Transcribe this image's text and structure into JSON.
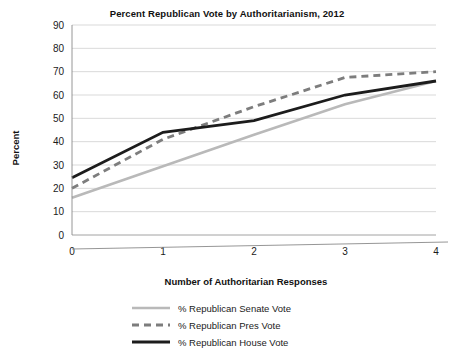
{
  "chart_data": {
    "type": "line",
    "title": "Percent Republican Vote by Authoritarianism, 2012",
    "xlabel": "Number of Authoritarian Responses",
    "ylabel": "Percent",
    "x": [
      0,
      1,
      2,
      3,
      4
    ],
    "xticklabels": [
      "0",
      "1",
      "2",
      "3",
      "4"
    ],
    "yticklabels": [
      "0",
      "10",
      "20",
      "30",
      "40",
      "50",
      "60",
      "70",
      "80",
      "90"
    ],
    "xlim": [
      0,
      4
    ],
    "ylim": [
      0,
      90
    ],
    "ytick_step": 10,
    "grid": "horizontal",
    "legend_position": "below",
    "series": [
      {
        "name": "% Republican Senate Vote",
        "values": [
          16,
          29.5,
          43,
          56,
          66
        ],
        "color": "#b9b9b9",
        "style": "solid",
        "width": 2.6
      },
      {
        "name": "% Republican Pres Vote",
        "values": [
          20,
          41,
          55,
          67.5,
          70
        ],
        "color": "#7d7d7d",
        "style": "dashed",
        "width": 2.8
      },
      {
        "name": "% Republican House Vote",
        "values": [
          24.5,
          44,
          49,
          60,
          66
        ],
        "color": "#1c1c1c",
        "style": "solid",
        "width": 2.8
      }
    ]
  },
  "legend": {
    "items": [
      {
        "label": "% Republican Senate Vote"
      },
      {
        "label": "% Republican Pres Vote"
      },
      {
        "label": "% Republican House Vote"
      }
    ]
  }
}
